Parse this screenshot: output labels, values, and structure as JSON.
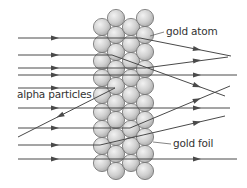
{
  "diagram": {
    "labels": {
      "gold_atom": "gold atom",
      "alpha_particles": "alpha particles",
      "gold_foil": "gold foil"
    },
    "colors": {
      "line": "#4a4a4a",
      "atom_fill_light": "#f2f2f2",
      "atom_fill_dark": "#a8a8a8",
      "atom_stroke": "#6e6e6e",
      "text": "#333333"
    },
    "atoms": {
      "radius": 8.6,
      "columns": [
        {
          "x": 102,
          "y": [
            27,
            44,
            61,
            78,
            95,
            112,
            129,
            146,
            163
          ]
        },
        {
          "x": 116,
          "y": [
            18,
            35,
            52,
            69,
            86,
            103,
            120,
            137,
            154,
            171
          ]
        },
        {
          "x": 131,
          "y": [
            27,
            44,
            61,
            78,
            95,
            112,
            129,
            146,
            163
          ]
        },
        {
          "x": 145,
          "y": [
            18,
            35,
            52,
            69,
            86,
            103,
            120,
            137,
            154,
            171
          ]
        }
      ]
    },
    "paths": [
      {
        "name": "deflected-down-1",
        "points": [
          [
            18,
            38
          ],
          [
            140,
            38
          ],
          [
            231,
            56
          ]
        ],
        "arrows": [
          [
            55,
            38
          ],
          [
            197,
            49.3
          ]
        ]
      },
      {
        "name": "deflected-down-2",
        "points": [
          [
            18,
            55
          ],
          [
            112,
            55
          ],
          [
            225,
            96
          ]
        ],
        "arrows": [
          [
            55,
            55
          ],
          [
            197,
            85.8
          ]
        ]
      },
      {
        "name": "deflected-up-1",
        "points": [
          [
            18,
            68
          ],
          [
            145,
            68
          ],
          [
            228,
            57
          ]
        ],
        "arrows": [
          [
            55,
            68
          ],
          [
            197,
            60.5
          ]
        ]
      },
      {
        "name": "straight-1",
        "points": [
          [
            18,
            75
          ],
          [
            237,
            75
          ]
        ],
        "arrows": [
          [
            55,
            75
          ],
          [
            197,
            75
          ]
        ]
      },
      {
        "name": "reflected-in",
        "points": [
          [
            18,
            88
          ],
          [
            115,
            88
          ]
        ],
        "arrows": [
          [
            55,
            88
          ]
        ]
      },
      {
        "name": "reflected-out",
        "points": [
          [
            115,
            88
          ],
          [
            18,
            137
          ]
        ],
        "arrows": [
          [
            60,
            115.8
          ]
        ],
        "reverse": true
      },
      {
        "name": "straight-2",
        "points": [
          [
            18,
            108
          ],
          [
            230,
            108
          ]
        ],
        "arrows": [
          [
            55,
            108
          ],
          [
            197,
            108
          ]
        ]
      },
      {
        "name": "deflected-up-2",
        "points": [
          [
            18,
            128
          ],
          [
            130,
            128
          ],
          [
            230,
            86
          ]
        ],
        "arrows": [
          [
            55,
            128
          ],
          [
            197,
            99.9
          ]
        ]
      },
      {
        "name": "deflected-up-3",
        "points": [
          [
            18,
            145
          ],
          [
            100,
            145
          ],
          [
            225,
            116
          ]
        ],
        "arrows": [
          [
            55,
            145
          ],
          [
            197,
            122.5
          ]
        ]
      },
      {
        "name": "straight-3",
        "points": [
          [
            18,
            159
          ],
          [
            237,
            159
          ]
        ],
        "arrows": [
          [
            55,
            159
          ],
          [
            197,
            159
          ]
        ]
      }
    ],
    "leaders": [
      {
        "name": "gold-atom-leader",
        "from": [
          164,
          32
        ],
        "to": [
          150,
          36
        ]
      },
      {
        "name": "gold-foil-leader",
        "from": [
          171,
          144
        ],
        "to": [
          153,
          142
        ]
      }
    ]
  }
}
